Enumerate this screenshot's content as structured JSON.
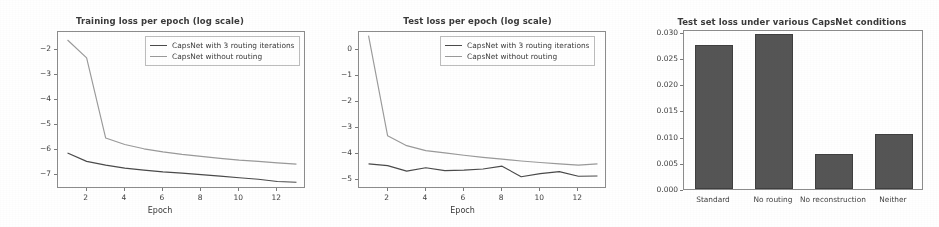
{
  "figure": {
    "background": "#ffffff",
    "panel_count": 3
  },
  "style": {
    "series_color_routing": "#4a4a4a",
    "series_color_norouting": "#9a9a9a",
    "bar_fill": "#555555",
    "bar_edge": "#3f3f3f",
    "axis_color": "#8c8c8c",
    "text_color": "#3a3a3a"
  },
  "chart_data": [
    {
      "type": "line",
      "title": "Training loss per epoch (log scale)",
      "xlabel": "Epoch",
      "ylabel": "",
      "x": [
        1,
        2,
        3,
        4,
        5,
        6,
        7,
        8,
        9,
        10,
        11,
        12,
        13
      ],
      "xlim": [
        0.5,
        13.5
      ],
      "ylim": [
        -7.55,
        -1.3
      ],
      "xticks": [
        2,
        4,
        6,
        8,
        10,
        12
      ],
      "yticks": [
        -2,
        -3,
        -4,
        -5,
        -6,
        -7
      ],
      "grid": false,
      "legend_position": "upper right",
      "series": [
        {
          "name": "CapsNet with 3 routing iterations",
          "color": "#4a4a4a",
          "values": [
            -6.12,
            -6.45,
            -6.6,
            -6.72,
            -6.8,
            -6.87,
            -6.92,
            -6.98,
            -7.04,
            -7.1,
            -7.16,
            -7.25,
            -7.28
          ]
        },
        {
          "name": "CapsNet without routing",
          "color": "#9a9a9a",
          "values": [
            -1.62,
            -2.33,
            -5.52,
            -5.78,
            -5.95,
            -6.07,
            -6.17,
            -6.25,
            -6.33,
            -6.4,
            -6.45,
            -6.51,
            -6.56
          ]
        }
      ]
    },
    {
      "type": "line",
      "title": "Test loss per epoch (log scale)",
      "xlabel": "Epoch",
      "ylabel": "",
      "x": [
        1,
        2,
        3,
        4,
        5,
        6,
        7,
        8,
        9,
        10,
        11,
        12,
        13
      ],
      "xlim": [
        0.5,
        13.5
      ],
      "ylim": [
        -5.35,
        0.7
      ],
      "xticks": [
        2,
        4,
        6,
        8,
        10,
        12
      ],
      "yticks": [
        0,
        -1,
        -2,
        -3,
        -4,
        -5
      ],
      "grid": false,
      "legend_position": "upper right",
      "series": [
        {
          "name": "CapsNet with 3 routing iterations",
          "color": "#4a4a4a",
          "values": [
            -4.38,
            -4.45,
            -4.66,
            -4.53,
            -4.64,
            -4.62,
            -4.58,
            -4.47,
            -4.88,
            -4.76,
            -4.68,
            -4.86,
            -4.85
          ]
        },
        {
          "name": "CapsNet without routing",
          "color": "#9a9a9a",
          "values": [
            0.56,
            -3.3,
            -3.68,
            -3.87,
            -3.96,
            -4.05,
            -4.13,
            -4.2,
            -4.27,
            -4.33,
            -4.38,
            -4.43,
            -4.38
          ]
        }
      ]
    },
    {
      "type": "bar",
      "title": "Test set loss under various CapsNet conditions",
      "xlabel": "",
      "ylabel": "",
      "categories": [
        "Standard",
        "No routing",
        "No reconstruction",
        "Neither"
      ],
      "values": [
        0.0275,
        0.0296,
        0.0066,
        0.0105
      ],
      "ylim": [
        0.0,
        0.0305
      ],
      "yticks": [
        0.0,
        0.005,
        0.01,
        0.015,
        0.02,
        0.025,
        0.03
      ],
      "ytick_labels": [
        "0.000",
        "0.005",
        "0.010",
        "0.015",
        "0.020",
        "0.025",
        "0.030"
      ],
      "grid": false,
      "bar_color": "#555555"
    }
  ]
}
